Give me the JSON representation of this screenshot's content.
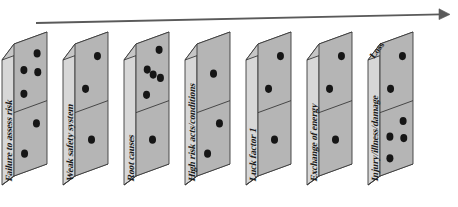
{
  "figure": {
    "background_color": "#ffffff"
  },
  "arrow": {
    "name": "progression-arrow",
    "direction": "left-to-right",
    "color": "#5a5a5a",
    "start": [
      36,
      23
    ],
    "end": [
      450,
      14
    ]
  },
  "palette": {
    "face_front": "#b5b5b5",
    "face_front_dark": "#a8a8a8",
    "face_side": "#d7d7d7",
    "face_top": "#c6c6c6",
    "outline": "#3a3a3a",
    "dot": "#161616",
    "shadow": "#8f8f8f"
  },
  "dominoes": [
    {
      "index": 1,
      "side_label": "Failure to assess risk",
      "top_label": "",
      "dots_top": 4,
      "dots_bottom": 2,
      "x": 14
    },
    {
      "index": 2,
      "side_label": "Weak safety system",
      "top_label": "",
      "dots_top": 2,
      "dots_bottom": 1,
      "x": 75
    },
    {
      "index": 3,
      "side_label": "Root causes",
      "top_label": "",
      "dots_top": 5,
      "dots_bottom": 1,
      "x": 136
    },
    {
      "index": 4,
      "side_label": "High risk acts/conditions",
      "top_label": "",
      "dots_top": 1,
      "dots_bottom": 2,
      "x": 197
    },
    {
      "index": 5,
      "side_label": "Luck factor 1",
      "top_label": "",
      "dots_top": 2,
      "dots_bottom": 1,
      "x": 258
    },
    {
      "index": 6,
      "side_label": "Exchange of energy",
      "top_label": "",
      "dots_top": 2,
      "dots_bottom": 1,
      "x": 319
    },
    {
      "index": 7,
      "side_label": "Injury/illness/damage",
      "top_label": "Loss",
      "dots_top": 2,
      "dots_bottom": 4,
      "x": 380
    }
  ]
}
